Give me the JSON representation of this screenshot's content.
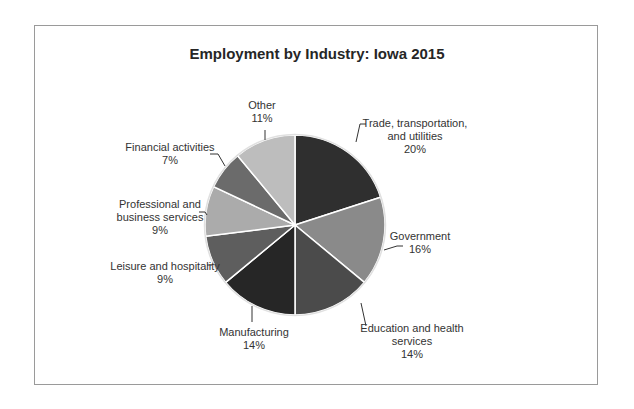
{
  "chart_data": {
    "type": "pie",
    "title": "Employment by Industry: Iowa 2015",
    "categories": [
      "Trade, transportation, and utilities",
      "Government",
      "Education and health services",
      "Manufacturing",
      "Leisure and hospitality",
      "Professional and business services",
      "Financial activities",
      "Other"
    ],
    "values": [
      20,
      16,
      14,
      14,
      9,
      9,
      7,
      11
    ],
    "unit": "%",
    "start_angle": "12 o'clock, clockwise",
    "colors": [
      "#2f2f2f",
      "#8a8a8a",
      "#4b4b4b",
      "#262626",
      "#5e5e5e",
      "#ababab",
      "#6b6b6b",
      "#bdbdbd"
    ],
    "labels": [
      {
        "lines": [
          "Trade, transportation,",
          "and utilities",
          "20%"
        ]
      },
      {
        "lines": [
          "Government",
          "16%"
        ]
      },
      {
        "lines": [
          "Education and health",
          "services",
          "14%"
        ]
      },
      {
        "lines": [
          "Manufacturing",
          "14%"
        ]
      },
      {
        "lines": [
          "Leisure and hospitality",
          "9%"
        ]
      },
      {
        "lines": [
          "Professional and",
          "business services",
          "9%"
        ]
      },
      {
        "lines": [
          "Financial activities",
          "7%"
        ]
      },
      {
        "lines": [
          "Other",
          "11%"
        ]
      }
    ],
    "legend": "none (data labels with leader lines)"
  }
}
